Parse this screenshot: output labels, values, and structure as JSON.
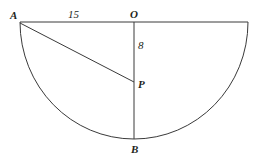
{
  "figure": {
    "stroke_color": "#3a3a3a",
    "background_color": "#ffffff",
    "labels": {
      "point_a": "A",
      "point_o": "O",
      "point_p": "P",
      "point_b": "B",
      "segment_ao_length": "15",
      "segment_op_length": "8"
    },
    "geometry": {
      "center": {
        "x": 134,
        "y": 22
      },
      "radius": 114,
      "point_a": {
        "x": 20,
        "y": 22
      },
      "point_right": {
        "x": 248,
        "y": 22
      },
      "point_b": {
        "x": 134,
        "y": 139
      },
      "point_p": {
        "x": 134,
        "y": 82
      },
      "diameter_line": "A to right endpoint along horizontal",
      "vertical_line": "O to B",
      "chord": "A to P",
      "arc": "semicircle below diameter from A to right endpoint"
    }
  }
}
